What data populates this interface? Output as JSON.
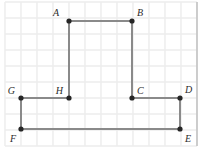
{
  "figure": {
    "kind": "grid-polygon-diagram",
    "canvas": {
      "width": 199,
      "height": 148
    },
    "colors": {
      "background": "#ffffff",
      "grid_minor": "#ececec",
      "grid_major": "#e2e2e2",
      "border": "#bdbdbd",
      "polygon_stroke": "#8a8a8a",
      "vertex_fill": "#262626",
      "label_color": "#2b2b2b"
    },
    "grid": {
      "visible": true,
      "spacing_px": 16,
      "origin_x": 5,
      "origin_y": 2,
      "cols": 12,
      "rows": 9
    },
    "polygon": {
      "closed": true,
      "stroke_width": 2,
      "vertex_radius": 2.6,
      "vertices": [
        {
          "id": "A",
          "label": "A",
          "x": 69,
          "y": 21,
          "label_dx": -10,
          "label_dy": -5,
          "label_anchor": "end"
        },
        {
          "id": "B",
          "label": "B",
          "x": 132,
          "y": 21,
          "label_dx": 5,
          "label_dy": -5,
          "label_anchor": "start"
        },
        {
          "id": "C",
          "label": "C",
          "x": 132,
          "y": 98,
          "label_dx": 5,
          "label_dy": -4,
          "label_anchor": "start"
        },
        {
          "id": "D",
          "label": "D",
          "x": 180,
          "y": 98,
          "label_dx": 5,
          "label_dy": -5,
          "label_anchor": "start"
        },
        {
          "id": "E",
          "label": "E",
          "x": 180,
          "y": 129,
          "label_dx": 5,
          "label_dy": 13,
          "label_anchor": "start"
        },
        {
          "id": "F",
          "label": "F",
          "x": 21,
          "y": 129,
          "label_dx": -5,
          "label_dy": 13,
          "label_anchor": "end"
        },
        {
          "id": "G",
          "label": "G",
          "x": 21,
          "y": 98,
          "label_dx": -6,
          "label_dy": -4,
          "label_anchor": "end"
        },
        {
          "id": "H",
          "label": "H",
          "x": 69,
          "y": 98,
          "label_dx": -6,
          "label_dy": -4,
          "label_anchor": "end"
        }
      ],
      "edges": [
        [
          "A",
          "B"
        ],
        [
          "B",
          "C"
        ],
        [
          "C",
          "D"
        ],
        [
          "D",
          "E"
        ],
        [
          "E",
          "F"
        ],
        [
          "F",
          "G"
        ],
        [
          "G",
          "H"
        ],
        [
          "H",
          "A"
        ]
      ]
    }
  }
}
